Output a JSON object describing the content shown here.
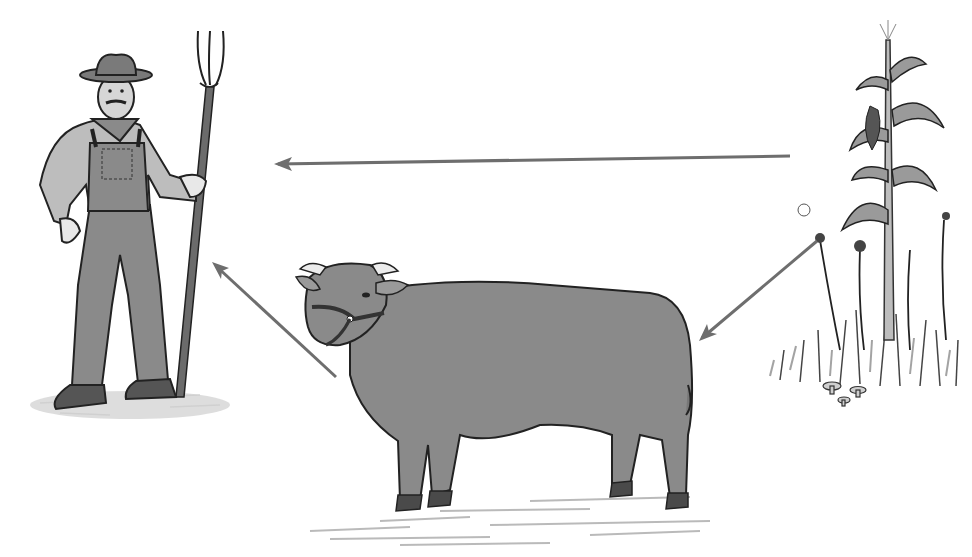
{
  "diagram": {
    "type": "food-chain",
    "background": "#ffffff",
    "colors": {
      "ink": "#222222",
      "fill_gray": "#8a8a8a",
      "light_gray": "#bdbdbd",
      "arrow": "#6e6e6e",
      "ground": "#a9a9a9"
    },
    "nodes": [
      {
        "id": "farmer",
        "depicts": "farmer with hat, overalls and pitchfork",
        "icon": "farmer-icon"
      },
      {
        "id": "cow",
        "depicts": "cow with halter",
        "icon": "cow-icon"
      },
      {
        "id": "plants",
        "depicts": "corn stalk with weeds, grass and mushrooms",
        "icon": "plants-icon"
      }
    ],
    "edges": [
      {
        "from": "plants",
        "to": "farmer",
        "x1": 790,
        "y1": 156,
        "x2": 276,
        "y2": 164
      },
      {
        "from": "plants",
        "to": "cow",
        "x1": 817,
        "y1": 241,
        "x2": 700,
        "y2": 340
      },
      {
        "from": "cow",
        "to": "farmer",
        "x1": 336,
        "y1": 377,
        "x2": 214,
        "y2": 264
      }
    ]
  }
}
